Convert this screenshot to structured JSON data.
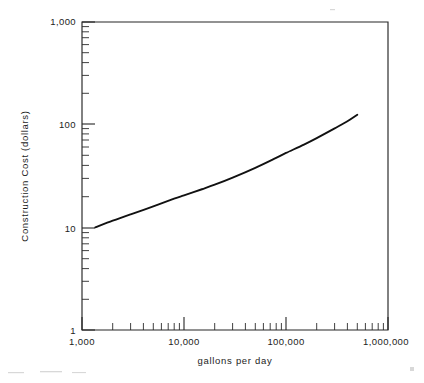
{
  "figure": {
    "background_color": "#ffffff",
    "ink_color": "#111111",
    "style": "scanned-line-drawing"
  },
  "chart_data": {
    "type": "line",
    "title": "",
    "xlabel": "gallons per day",
    "ylabel": "Construction Cost (dollars)",
    "xscale": "log",
    "yscale": "log",
    "xlim": [
      1000,
      1000000
    ],
    "ylim": [
      1,
      1000
    ],
    "grid": false,
    "legend": null,
    "x_tick_labels": [
      "1,000",
      "10,000",
      "100,000",
      "1,000,000"
    ],
    "x_tick_values": [
      1000,
      10000,
      100000,
      1000000
    ],
    "y_tick_labels": [
      "1",
      "10",
      "100",
      "1,000"
    ],
    "y_tick_values": [
      1,
      10,
      100,
      1000
    ],
    "x_minor_ticks": [
      2000,
      3000,
      4000,
      5000,
      6000,
      7000,
      8000,
      9000,
      20000,
      30000,
      40000,
      50000,
      60000,
      70000,
      80000,
      90000,
      200000,
      300000,
      400000,
      500000,
      600000,
      700000,
      800000,
      900000
    ],
    "y_minor_ticks": [
      2,
      3,
      4,
      5,
      6,
      7,
      8,
      9,
      20,
      30,
      40,
      50,
      60,
      70,
      80,
      90,
      200,
      300,
      400,
      500,
      600,
      700,
      800,
      900
    ],
    "series": [
      {
        "name": "construction cost",
        "x": [
          1350,
          2000,
          3000,
          5000,
          8000,
          10000,
          15000,
          20000,
          30000,
          50000,
          80000,
          100000,
          150000,
          200000,
          300000,
          400000,
          500000
        ],
        "y": [
          10.0,
          11.6,
          13.4,
          16.0,
          19.0,
          20.5,
          23.5,
          26.0,
          30.5,
          38.0,
          47.5,
          53.0,
          64.0,
          74.0,
          92.0,
          108.0,
          125.0
        ]
      }
    ],
    "annotations": []
  },
  "axis_labels": {
    "y_top": "1,000",
    "y_mid_upper": "100",
    "y_mid_lower": "10",
    "y_bottom": "1",
    "x_left": "1,000",
    "x_mid_left": "10,000",
    "x_mid_right": "100,000",
    "x_right": "1,000,000",
    "x_title": "gallons per day",
    "y_title": "Construction Cost (dollars)"
  }
}
